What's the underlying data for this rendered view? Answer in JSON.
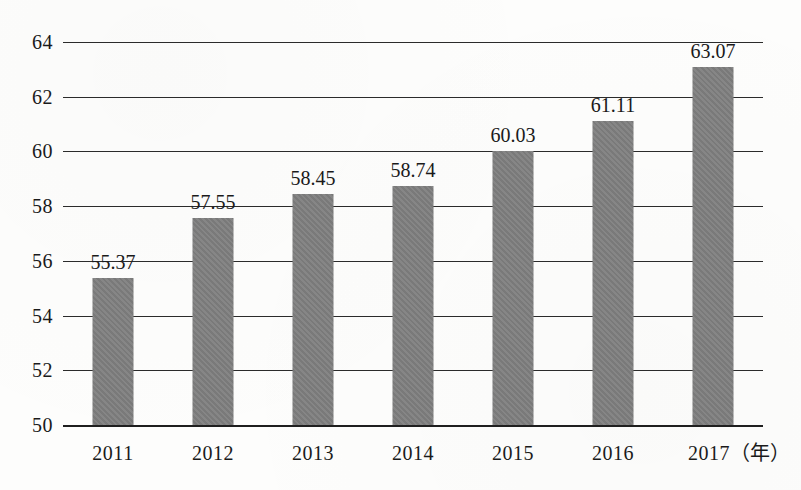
{
  "chart_data": {
    "type": "bar",
    "title": "",
    "subtitle": "",
    "xlabel": "年",
    "ylabel": "",
    "categories": [
      "2011",
      "2012",
      "2013",
      "2014",
      "2015",
      "2016",
      "2017"
    ],
    "values": [
      55.37,
      57.55,
      58.45,
      58.74,
      60.03,
      61.11,
      63.07
    ],
    "value_labels": [
      "55.37",
      "57.55",
      "58.45",
      "58.74",
      "60.03",
      "61.11",
      "63.07"
    ],
    "ylim": [
      50,
      64
    ],
    "ytick_labels": [
      "50",
      "52",
      "54",
      "56",
      "58",
      "60",
      "62",
      "64"
    ],
    "ytick_values": [
      50,
      52,
      54,
      56,
      58,
      60,
      62,
      64
    ],
    "xtick_labels": [
      "2011",
      "2012",
      "2013",
      "2014",
      "2015",
      "2016",
      "2017"
    ],
    "x_axis_unit_label": "（年）",
    "last_xtick_full_label": "2017（年）",
    "grid": true,
    "legend": false,
    "legend_position": "none",
    "series": [
      {
        "name": "",
        "values": [
          55.37,
          57.55,
          58.45,
          58.74,
          60.03,
          61.11,
          63.07
        ]
      }
    ],
    "colors": {
      "bar_fill": "#808080",
      "gridline": "#2b2b2b",
      "axis": "#1f1f1f",
      "text": "#1a1a1a",
      "background": "#fdfdfc"
    }
  }
}
